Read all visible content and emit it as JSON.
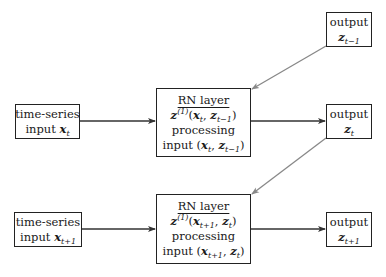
{
  "diagram": {
    "type": "flow",
    "nodes": {
      "input_t": {
        "line1": "time-series",
        "line2_text": "input ",
        "var": "x",
        "sub": "t"
      },
      "rn_t": {
        "title": "RN layer",
        "fn": "z",
        "sup": "(1)",
        "args_open": "(",
        "arg1": "x",
        "arg1_sub": "t",
        "sep": ", ",
        "arg2": "z",
        "arg2_sub": "t−1",
        "args_close": ")",
        "line3": "processing",
        "line4_text": "input "
      },
      "output_t": {
        "line1": "output",
        "var": "z",
        "sub": "t"
      },
      "output_tm1": {
        "line1": "output",
        "var": "z",
        "sub": "t−1"
      },
      "input_tp1": {
        "line1": "time-series",
        "line2_text": "input ",
        "var": "x",
        "sub": "t+1"
      },
      "rn_tp1": {
        "title": "RN layer",
        "fn": "z",
        "sup": "(1)",
        "args_open": "(",
        "arg1": "x",
        "arg1_sub": "t+1",
        "sep": ", ",
        "arg2": "z",
        "arg2_sub": "t",
        "args_close": ")",
        "line3": "processing",
        "line4_text": "input "
      },
      "output_tp1": {
        "line1": "output",
        "var": "z",
        "sub": "t+1"
      }
    },
    "edges": [
      {
        "from": "input_t",
        "to": "rn_t",
        "color": "#333333"
      },
      {
        "from": "rn_t",
        "to": "output_t",
        "color": "#333333"
      },
      {
        "from": "output_tm1",
        "to": "rn_t",
        "color": "#888888"
      },
      {
        "from": "input_tp1",
        "to": "rn_tp1",
        "color": "#333333"
      },
      {
        "from": "rn_tp1",
        "to": "output_tp1",
        "color": "#333333"
      },
      {
        "from": "output_t",
        "to": "rn_tp1",
        "color": "#888888"
      }
    ]
  }
}
